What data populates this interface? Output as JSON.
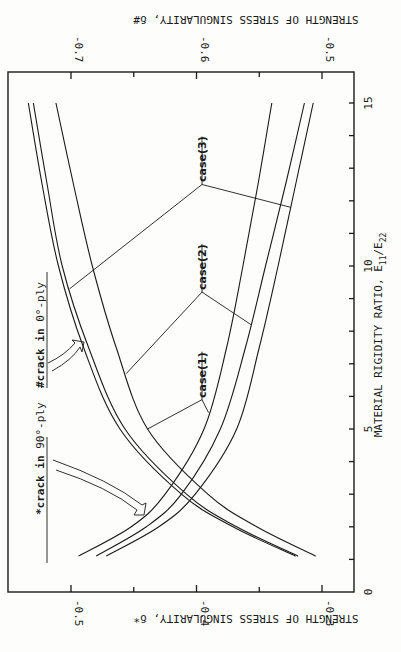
{
  "chart_data": {
    "type": "line",
    "orientation": "rotated-90-clockwise",
    "title": "",
    "xlabel": "MATERIAL RIGIDITY RATIO, E11/E22",
    "xlabel_main": "MATERIAL RIGIDITY RATIO, E",
    "xlabel_sub1": "11",
    "xlabel_slash": "/E",
    "xlabel_sub2": "22",
    "xlim": [
      0,
      15.5
    ],
    "xticks": [
      0,
      5,
      10,
      15
    ],
    "xtick_labels": [
      "0",
      "5",
      "10",
      "15"
    ],
    "ylabel_bottom": "STRENGTH OF STRESS SINGULARITY, δ*",
    "ylim_bottom": [
      -0.555,
      -0.275
    ],
    "yticks_bottom": [
      -0.5,
      -0.4,
      -0.3
    ],
    "ytick_labels_bottom": [
      "-0.5",
      "-0.4",
      "-0.3"
    ],
    "ylabel_top": "STRENGTH OF STRESS SINGULARITY, δ#",
    "ylim_top": [
      -0.755,
      -0.475
    ],
    "yticks_top": [
      -0.7,
      -0.6,
      -0.5
    ],
    "ytick_labels_top": [
      "-0.7",
      "-0.6",
      "-0.5"
    ],
    "x": [
      1.1,
      2,
      3,
      5,
      7.5,
      10,
      12.5,
      15
    ],
    "series": [
      {
        "name": "*crack in 90°-ply case(1)",
        "axis": "bottom",
        "values": [
          -0.494,
          -0.452,
          -0.425,
          -0.394,
          -0.376,
          -0.363,
          -0.351,
          -0.34
        ]
      },
      {
        "name": "*crack in 90°-ply case(2)",
        "axis": "bottom",
        "values": [
          -0.48,
          -0.44,
          -0.412,
          -0.381,
          -0.361,
          -0.345,
          -0.329,
          -0.314
        ]
      },
      {
        "name": "*crack in 90°-ply case(3)",
        "axis": "bottom",
        "values": [
          -0.472,
          -0.43,
          -0.401,
          -0.368,
          -0.35,
          -0.335,
          -0.321,
          -0.307
        ]
      },
      {
        "name": "#crack in 0°-ply case(1)",
        "axis": "top",
        "values": [
          -0.521,
          -0.571,
          -0.612,
          -0.661,
          -0.69,
          -0.71,
          -0.723,
          -0.734
        ]
      },
      {
        "name": "#crack in 0°-ply case(2)",
        "axis": "top",
        "values": [
          -0.519,
          -0.568,
          -0.608,
          -0.657,
          -0.686,
          -0.707,
          -0.719,
          -0.73
        ]
      },
      {
        "name": "#crack in 0°-ply case(3)",
        "axis": "top",
        "values": [
          -0.505,
          -0.552,
          -0.591,
          -0.639,
          -0.664,
          -0.683,
          -0.698,
          -0.712
        ]
      }
    ],
    "annotations": [
      {
        "text": "case(1)",
        "x": 5.9
      },
      {
        "text": "case(2)",
        "x": 9.2
      },
      {
        "text": "case(3)",
        "x": 12.5
      },
      {
        "text": "*crack in 90°-ply"
      },
      {
        "text": "#crack in 0°-ply"
      }
    ],
    "grid": false,
    "legend": "none"
  },
  "labels": {
    "crack90_star": "*",
    "crack90_a": "crack in ",
    "crack90_b": "90°-ply",
    "crack0_hash": "#",
    "crack0_a": "crack in ",
    "crack0_b": "0°-ply",
    "case1": "case(1)",
    "case2": "case(2)",
    "case3": "case(3)"
  }
}
